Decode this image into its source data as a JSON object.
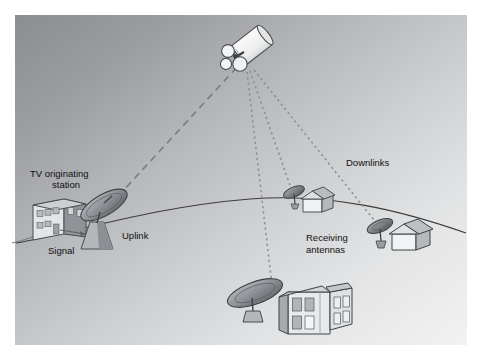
{
  "figure": {
    "frame": {
      "margin_left": 15,
      "margin_top": 15,
      "margin_right": 12,
      "margin_bottom": 12,
      "background_top_left": "#8e9094",
      "background_bottom_right": "#f2f2f2",
      "page_background": "#ffffff"
    },
    "colors": {
      "ink": "#2b2b2b",
      "label_text": "#111111",
      "horizon_line": "#3a3a3a",
      "uplink_line": "#7d7f83",
      "downlink_line": "#8a8c90",
      "dish_dark": "#6e7276",
      "dish_mid": "#9a9ea2",
      "dish_light": "#c8cacd",
      "building_light": "#e9eaec",
      "building_mid": "#b9bcc0",
      "building_dark": "#8f9397",
      "roof_light": "#d8dadd",
      "satellite_body": "#f4f5f6",
      "satellite_shadow": "#c9cbce"
    }
  },
  "labels": {
    "tv_station_line1": "TV originating",
    "tv_station_line2": "station",
    "signal": "Signal",
    "uplink": "Uplink",
    "downlinks": "Downlinks",
    "receiving_line1": "Receiving",
    "receiving_line2": "antennas"
  },
  "nodes": {
    "satellite": {
      "name": "communications-satellite",
      "x": 243,
      "y": 55
    },
    "uplink_dish": {
      "name": "uplink-parabolic-dish",
      "x": 96,
      "y": 215
    },
    "tv_station_building": {
      "name": "tv-originating-station-building",
      "x": 56,
      "y": 218
    },
    "ground_station": {
      "name": "ground-receiving-station",
      "x": 290,
      "y": 305
    },
    "receiver_house_left": {
      "name": "receiving-house-left",
      "x": 315,
      "y": 200
    },
    "receiver_house_right": {
      "name": "receiving-house-right",
      "x": 400,
      "y": 233
    }
  },
  "links": [
    {
      "name": "uplink-path",
      "style": "dashed",
      "from": "uplink_dish",
      "to": "satellite"
    },
    {
      "name": "downlink-path-ground-station",
      "style": "dotted",
      "from": "satellite",
      "to": "ground_station"
    },
    {
      "name": "downlink-path-house-left",
      "style": "dotted",
      "from": "satellite",
      "to": "receiver_house_left"
    },
    {
      "name": "downlink-path-house-right",
      "style": "dotted",
      "from": "satellite",
      "to": "receiver_house_right"
    }
  ]
}
